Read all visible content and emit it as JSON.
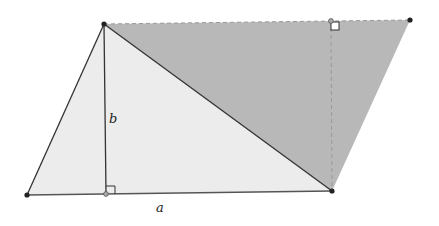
{
  "diagram": {
    "labels": {
      "height": "b",
      "base": "a"
    },
    "colors": {
      "light_fill": "#ececec",
      "dark_fill": "#b8b8b8",
      "stroke": "#333333",
      "dashed": "#999999"
    }
  }
}
